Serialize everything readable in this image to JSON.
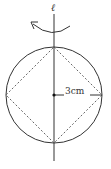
{
  "diagram": {
    "axis_label": "ℓ",
    "radius_label": "3cm",
    "shapes": {
      "circle": {
        "cx": 54,
        "cy": 95,
        "r": 48,
        "stroke": "#333333",
        "style": "solid"
      },
      "inscribed_square": {
        "points": "54,47 102,95 54,143 6,95",
        "stroke": "#555555",
        "style": "dashed"
      },
      "axis": {
        "x": 54,
        "y1": 14,
        "y2": 161
      },
      "radius_segment": {
        "x1": 54,
        "y1": 95,
        "x2": 102,
        "y2": 95
      },
      "center_point": {
        "x": 54,
        "y": 95
      },
      "rotation_arrow": {
        "direction": "counterclockwise"
      }
    }
  }
}
